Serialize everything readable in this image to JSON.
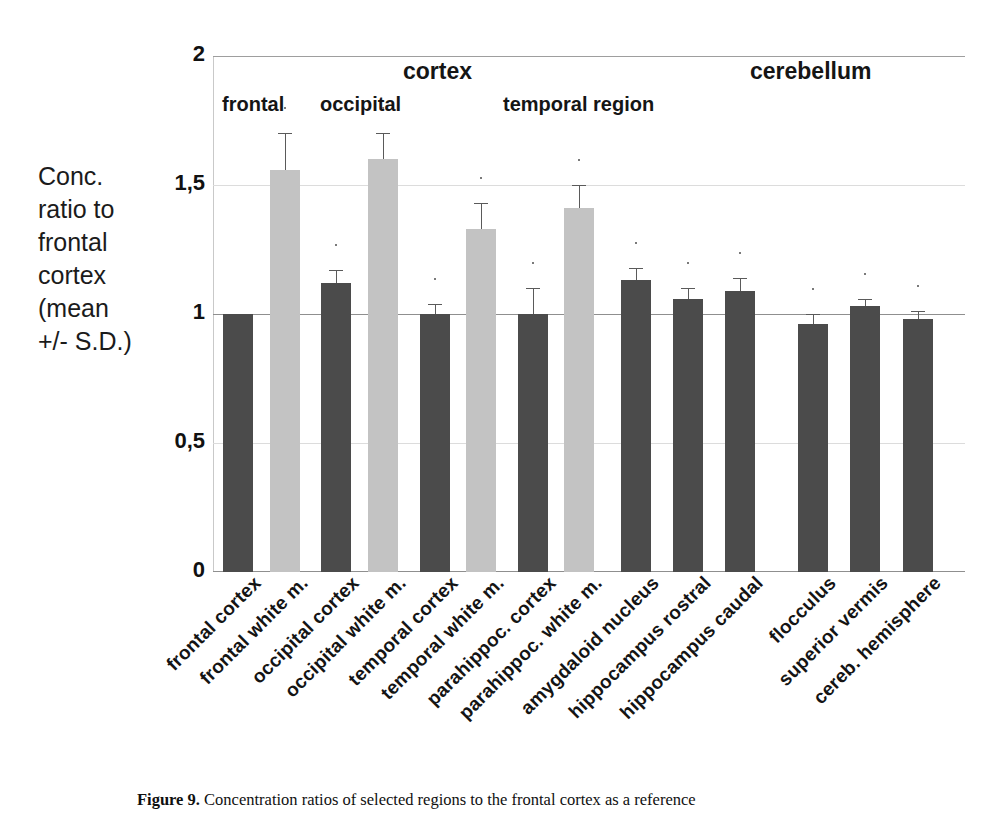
{
  "figure": {
    "caption_label": "Figure 9.",
    "caption_text": "Concentration ratios of selected regions to the frontal cortex as a reference"
  },
  "chart_data": {
    "type": "bar",
    "title": "",
    "xlabel": "",
    "ylabel": "Conc. ratio to frontal cortex (mean +/- S.D.)",
    "ylim": [
      0,
      2
    ],
    "ytick_labels": [
      "2",
      "1,5",
      "1",
      "0,5",
      "0"
    ],
    "ytick_values": [
      2,
      1.5,
      1,
      0.5,
      0
    ],
    "grid": true,
    "reference_line": 1,
    "legend_position": "none",
    "group_headers": [
      {
        "label": "cortex"
      },
      {
        "label": "cerebellum"
      }
    ],
    "sub_headers": [
      {
        "label": "frontal"
      },
      {
        "label": "occipital"
      },
      {
        "label": "temporal region"
      }
    ],
    "categories": [
      "frontal cortex",
      "frontal white m.",
      "occipital cortex",
      "occipital white m.",
      "temporal cortex",
      "temporal white m.",
      "parahippoc. cortex",
      "parahippoc. white m.",
      "amygdaloid nucleus",
      "hippocampus rostral",
      "hippocampus caudal",
      "flocculus",
      "superior vermis",
      "cereb. hemisphere"
    ],
    "values": [
      1.0,
      1.56,
      1.12,
      1.6,
      1.0,
      1.33,
      1.0,
      1.41,
      1.13,
      1.06,
      1.09,
      0.96,
      1.03,
      0.98
    ],
    "errors": [
      0.0,
      0.14,
      0.05,
      0.1,
      0.04,
      0.1,
      0.1,
      0.09,
      0.05,
      0.04,
      0.05,
      0.04,
      0.03,
      0.03
    ],
    "bar_shades": [
      "dark",
      "light",
      "dark",
      "light",
      "dark",
      "light",
      "dark",
      "light",
      "dark",
      "dark",
      "dark",
      "dark",
      "dark",
      "dark"
    ],
    "colors": {
      "dark_bar": "#4b4b4b",
      "light_bar": "#c3c3c3",
      "gridline": "#b9b9b9",
      "error_bar": "#5a5a5a",
      "text": "#141414",
      "background": "#ffffff"
    }
  }
}
